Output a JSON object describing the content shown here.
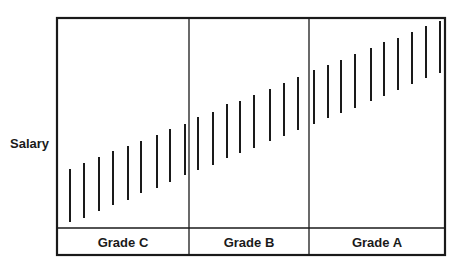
{
  "chart_data": {
    "type": "bar",
    "subtype": "floating-range",
    "title": "",
    "xlabel": "",
    "ylabel": "Salary",
    "grid": false,
    "legend": null,
    "categories": [
      "Grade C",
      "Grade B",
      "Grade A"
    ],
    "frame": {
      "left": 57,
      "top": 18,
      "right": 445,
      "bottom": 255,
      "label_row_top": 228,
      "dividers": [
        189,
        309
      ]
    },
    "series": [
      {
        "name": "Grade C",
        "ranges": [
          {
            "x": 70,
            "top": 169,
            "bottom": 222
          },
          {
            "x": 84,
            "top": 163,
            "bottom": 218
          },
          {
            "x": 99,
            "top": 157,
            "bottom": 211
          },
          {
            "x": 113,
            "top": 151,
            "bottom": 205
          },
          {
            "x": 128,
            "top": 146,
            "bottom": 200
          },
          {
            "x": 141,
            "top": 141,
            "bottom": 193
          },
          {
            "x": 157,
            "top": 135,
            "bottom": 188
          },
          {
            "x": 170,
            "top": 129,
            "bottom": 182
          },
          {
            "x": 185,
            "top": 124,
            "bottom": 175
          }
        ]
      },
      {
        "name": "Grade B",
        "ranges": [
          {
            "x": 198,
            "top": 117,
            "bottom": 170
          },
          {
            "x": 213,
            "top": 112,
            "bottom": 165
          },
          {
            "x": 227,
            "top": 104,
            "bottom": 158
          },
          {
            "x": 240,
            "top": 101,
            "bottom": 153
          },
          {
            "x": 254,
            "top": 95,
            "bottom": 148
          },
          {
            "x": 270,
            "top": 89,
            "bottom": 141
          },
          {
            "x": 284,
            "top": 83,
            "bottom": 136
          },
          {
            "x": 298,
            "top": 77,
            "bottom": 130
          }
        ]
      },
      {
        "name": "Grade A",
        "ranges": [
          {
            "x": 314,
            "top": 70,
            "bottom": 124
          },
          {
            "x": 328,
            "top": 65,
            "bottom": 118
          },
          {
            "x": 341,
            "top": 60,
            "bottom": 113
          },
          {
            "x": 355,
            "top": 54,
            "bottom": 108
          },
          {
            "x": 371,
            "top": 48,
            "bottom": 101
          },
          {
            "x": 384,
            "top": 42,
            "bottom": 96
          },
          {
            "x": 398,
            "top": 38,
            "bottom": 90
          },
          {
            "x": 412,
            "top": 32,
            "bottom": 84
          },
          {
            "x": 426,
            "top": 26,
            "bottom": 78
          },
          {
            "x": 440,
            "top": 21,
            "bottom": 73
          }
        ]
      }
    ]
  },
  "labels": {
    "y_axis": "Salary",
    "grades": [
      "Grade C",
      "Grade B",
      "Grade A"
    ]
  },
  "colors": {
    "ink": "#1a1a1a",
    "background": "#ffffff"
  }
}
